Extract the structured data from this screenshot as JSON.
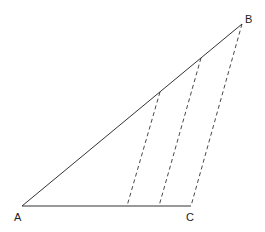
{
  "diagram": {
    "type": "geometry",
    "stroke_color": "#333333",
    "vertices": {
      "A": {
        "label": "A",
        "x": 22,
        "y": 206
      },
      "B": {
        "label": "B",
        "x": 242,
        "y": 24
      },
      "C": {
        "label": "C",
        "x": 191,
        "y": 206
      }
    },
    "labels": {
      "A": "A",
      "B": "B",
      "C": "C"
    },
    "solid_segments": [
      {
        "from": "A",
        "to": "B"
      },
      {
        "from": "A",
        "to": "C"
      }
    ],
    "dashed_segments": [
      {
        "x1": 160,
        "y1": 92,
        "x2": 127,
        "y2": 206
      },
      {
        "x1": 201,
        "y1": 58,
        "x2": 159,
        "y2": 206
      },
      {
        "x1": 242,
        "y1": 24,
        "x2": 191,
        "y2": 206
      }
    ]
  }
}
